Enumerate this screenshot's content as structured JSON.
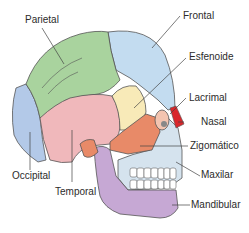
{
  "diagram": {
    "labels": {
      "parietal": "Parietal",
      "frontal": "Frontal",
      "esfenoide": "Esfenoide",
      "lacrimal": "Lacrimal",
      "nasal": "Nasal",
      "zigomatico": "Zigomático",
      "maxilar": "Maxilar",
      "mandibular": "Mandibular",
      "occipital": "Occipital",
      "temporal": "Temporal"
    },
    "colors": {
      "parietal": "#a9d39e",
      "frontal": "#c3dcf0",
      "occipital": "#b3c9e8",
      "temporal": "#f0b8bb",
      "esfenoide": "#f8eab8",
      "zigomatico": "#e88a68",
      "lacrimal": "#f3c4b0",
      "nasal": "#d9262b",
      "maxilar": "#d5e3ee",
      "mandibular": "#c6a8d4",
      "outline": "#555555"
    }
  }
}
